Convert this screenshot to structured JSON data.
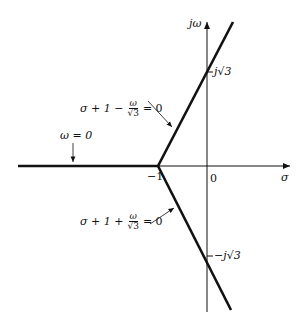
{
  "figure": {
    "type": "root-locus-asymptotes",
    "axes": {
      "horizontal_label": "σ",
      "vertical_label": "jω",
      "origin_label": "0",
      "vertex_label": "−1"
    },
    "markers": {
      "upper": {
        "text": "j√3",
        "prefix": "−"
      },
      "lower": {
        "text": "−j√3",
        "prefix": "−"
      }
    },
    "annotations": {
      "omega_zero": {
        "text": "ω = 0"
      },
      "upper_line": {
        "left": "σ + 1 −",
        "num": "ω",
        "den": "√3",
        "right": "= 0"
      },
      "lower_line": {
        "left": "σ + 1 +",
        "num": "ω",
        "den": "√3",
        "right": "= 0"
      }
    },
    "colors": {
      "line": "#111111",
      "background": "#ffffff"
    }
  }
}
